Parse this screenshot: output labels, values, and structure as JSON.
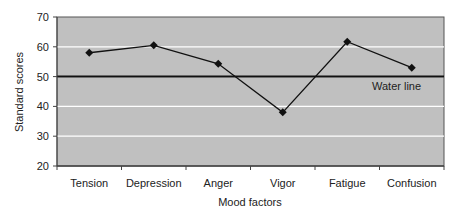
{
  "chart_data": {
    "type": "line",
    "title": "",
    "xlabel": "Mood factors",
    "ylabel": "Standard scores",
    "categories": [
      "Tension",
      "Depression",
      "Anger",
      "Vigor",
      "Fatigue",
      "Confusion"
    ],
    "series": [
      {
        "name": "Mood profile",
        "values": [
          58,
          60.5,
          54.3,
          38,
          61.7,
          53
        ],
        "marker": "diamond",
        "color": "#111111"
      }
    ],
    "yticks": [
      20,
      30,
      40,
      50,
      60,
      70
    ],
    "ylim": [
      20,
      70
    ],
    "grid": true,
    "legend": "none",
    "annotations": [
      {
        "type": "hline",
        "y": 50,
        "label": "Water line",
        "color": "#111111"
      }
    ],
    "colors": {
      "plot_background": "#c0c0c0",
      "gridline": "#ffffff",
      "line": "#111111"
    }
  }
}
